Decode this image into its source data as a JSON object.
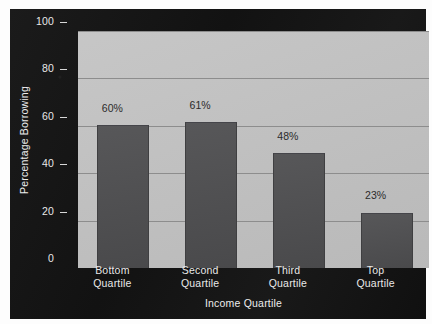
{
  "chart_data": {
    "type": "bar",
    "title": "",
    "subtitle": "",
    "xlabel": "Income Quartile",
    "ylabel": "Percentage Borrowing",
    "categories": [
      "Bottom Quartile",
      "Second Quartile",
      "Third Quartile",
      "Top Quartile"
    ],
    "category_lines": [
      [
        "Bottom",
        "Quartile"
      ],
      [
        "Second",
        "Quartile"
      ],
      [
        "Third",
        "Quartile"
      ],
      [
        "Top",
        "Quartile"
      ]
    ],
    "values": [
      60,
      61,
      48,
      23
    ],
    "data_labels": [
      "60%",
      "61%",
      "48%",
      "23%"
    ],
    "ylim": [
      0,
      100
    ],
    "yticks": [
      0,
      20,
      40,
      60,
      80,
      100
    ],
    "ytick_labels": [
      "0",
      "20",
      "40",
      "60",
      "80",
      "100"
    ],
    "grid": "horizontal",
    "legend": "none",
    "colors": {
      "panel_background": "#151515",
      "plot_background": "#c3c3c3",
      "bar": "#4e4e50",
      "gridline": "#8d8d8d",
      "axis_text": "#e9e9e9",
      "data_label_text": "#2b2b2b"
    }
  }
}
